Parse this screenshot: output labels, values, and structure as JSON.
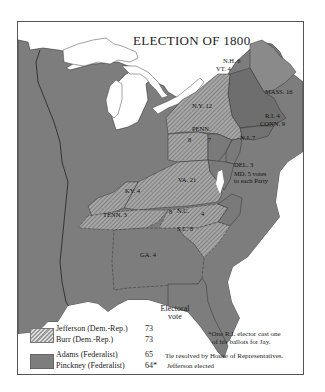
{
  "title": "ELECTION OF 1800",
  "colors": {
    "federalist_fill": "#7d7d7d",
    "democratic_republican_hatch": "#8f8f8f",
    "water": "#ffffff",
    "border": "#555555"
  },
  "state_labels": {
    "nh": "N.H. 6",
    "vt": "VT. 4",
    "mass": "MASS. 16",
    "ny": "N.Y. 12",
    "ri": "R.I. 4",
    "conn": "CONN. 9",
    "penn": "PENN.",
    "penn_rep": "8",
    "penn_fed": "7",
    "nj": "N.J. 7",
    "del": "DEL. 3",
    "md_line1": "MD. 5 votes",
    "md_line2": "to each Party",
    "va": "VA. 21",
    "ky": "KY. 4",
    "tenn": "TENN. 3",
    "nc": "N.C.",
    "nc_rep": "8",
    "nc_fed": "4",
    "sc": "S.C. 8",
    "ga": "GA. 4"
  },
  "legend": {
    "heading_line1": "Electoral",
    "heading_line2": "vote",
    "entries": [
      {
        "candidate": "Jefferson (Dem.-Rep.)",
        "votes": "73",
        "party": "Democratic-Republican",
        "pattern": "hatched"
      },
      {
        "candidate": "Burr  (Dem.-Rep.)",
        "votes": "73",
        "party": "Democratic-Republican",
        "pattern": "hatched"
      },
      {
        "candidate": "Adams (Federalist)",
        "votes": "65",
        "party": "Federalist",
        "pattern": "solid"
      },
      {
        "candidate": "Pinckney (Federalist)",
        "votes": "64*",
        "party": "Federalist",
        "pattern": "solid"
      }
    ]
  },
  "notes": {
    "footnote_line1": "*One R.I. elector cast one",
    "footnote_line2": "of his ballots for Jay.",
    "result_line1": "Tie resolved by House of Representatives.",
    "result_line2": "Jefferson elected"
  }
}
